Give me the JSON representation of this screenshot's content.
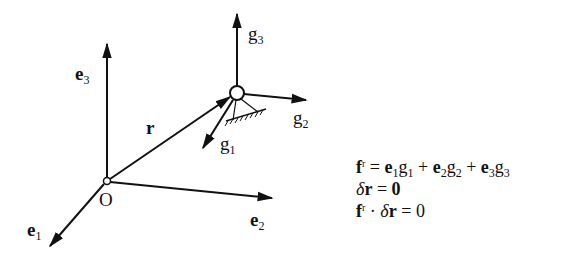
{
  "diagram": {
    "origin_label": "O",
    "labels": {
      "e1": {
        "base": "e",
        "sub": "1"
      },
      "e2": {
        "base": "e",
        "sub": "2"
      },
      "e3": {
        "base": "e",
        "sub": "3"
      },
      "r": "r",
      "g1": {
        "base": "g",
        "sub": "1"
      },
      "g2": {
        "base": "g",
        "sub": "2"
      },
      "g3": {
        "base": "g",
        "sub": "3"
      }
    },
    "colors": {
      "stroke": "#111111",
      "background": "#ffffff"
    }
  },
  "equations": {
    "eq1": {
      "lhs": "f",
      "lhs_sup": "r",
      "eq": " = ",
      "t1": "e",
      "t1s": "1",
      "t1g": "g",
      "t1gs": "1",
      "plus1": " + ",
      "t2": "e",
      "t2s": "2",
      "t2g": "g",
      "t2gs": "2",
      "plus2": " + ",
      "t3": "e",
      "t3s": "3",
      "t3g": "g",
      "t3gs": "3"
    },
    "eq2": {
      "delta": "δ",
      "r": "r",
      "eq": " = ",
      "rhs": "0"
    },
    "eq3": {
      "lhs": "f",
      "lhs_sup": "r",
      "dot": " · ",
      "delta": "δ",
      "r": "r",
      "eq": " = ",
      "rhs": "0"
    }
  }
}
